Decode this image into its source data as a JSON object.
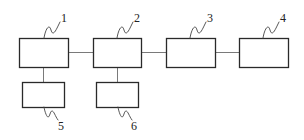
{
  "diagram": {
    "type": "block-diagram",
    "colors": {
      "box_stroke": "#2a2a2a",
      "connector": "#7a7a7a",
      "leader": "#444444",
      "label": "#222222",
      "background": "#ffffff"
    },
    "blocks": [
      {
        "id": "1",
        "label": "1",
        "x": 19,
        "y": 38,
        "w": 49,
        "h": 29
      },
      {
        "id": "2",
        "label": "2",
        "x": 93,
        "y": 38,
        "w": 48,
        "h": 29
      },
      {
        "id": "3",
        "label": "3",
        "x": 166,
        "y": 38,
        "w": 49,
        "h": 29
      },
      {
        "id": "4",
        "label": "4",
        "x": 239,
        "y": 38,
        "w": 49,
        "h": 29
      },
      {
        "id": "5",
        "label": "5",
        "x": 22,
        "y": 82,
        "w": 42,
        "h": 25
      },
      {
        "id": "6",
        "label": "6",
        "x": 96,
        "y": 82,
        "w": 42,
        "h": 25
      }
    ],
    "connections": [
      {
        "from": "1",
        "to": "2",
        "direction": "horizontal"
      },
      {
        "from": "2",
        "to": "3",
        "direction": "horizontal"
      },
      {
        "from": "3",
        "to": "4",
        "direction": "horizontal"
      },
      {
        "from": "1",
        "to": "5",
        "direction": "vertical"
      },
      {
        "from": "2",
        "to": "6",
        "direction": "vertical"
      }
    ],
    "reference_labels": [
      {
        "text": "1",
        "x": 62,
        "y": 20
      },
      {
        "text": "2",
        "x": 135,
        "y": 20
      },
      {
        "text": "3",
        "x": 208,
        "y": 20
      },
      {
        "text": "4",
        "x": 281,
        "y": 20
      },
      {
        "text": "5",
        "x": 58,
        "y": 129
      },
      {
        "text": "6",
        "x": 132,
        "y": 129
      }
    ]
  }
}
